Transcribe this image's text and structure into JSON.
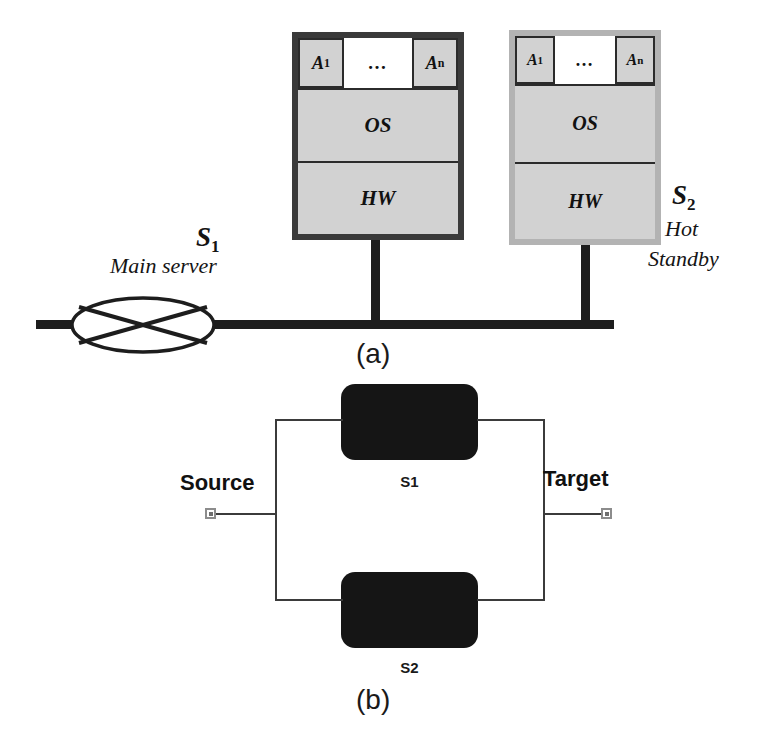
{
  "figure": {
    "part_a_caption": "(a)",
    "part_b_caption": "(b)"
  },
  "part_a": {
    "servers": [
      {
        "id": "S",
        "subscript": "1",
        "role_line1": "Main server",
        "role_line2": "",
        "apps": [
          {
            "name": "A",
            "subscript": "1"
          },
          {
            "name": "…",
            "subscript": ""
          },
          {
            "name": "A",
            "subscript": "n"
          }
        ],
        "layers": [
          "OS",
          "HW"
        ],
        "border_color": "#3a3a3a",
        "fill_color": "#d2d2d2"
      },
      {
        "id": "S",
        "subscript": "2",
        "role_line1": "Hot",
        "role_line2": "Standby",
        "apps": [
          {
            "name": "A",
            "subscript": "1"
          },
          {
            "name": "…",
            "subscript": ""
          },
          {
            "name": "A",
            "subscript": "n"
          }
        ],
        "layers": [
          "OS",
          "HW"
        ],
        "border_color": "#b3b3b3",
        "fill_color": "#d2d2d2"
      }
    ],
    "bus": {
      "terminator_icon": "crossed-ellipse-icon",
      "line_color": "#1d1d1d"
    }
  },
  "part_b": {
    "source_label": "Source",
    "target_label": "Target",
    "blocks": [
      {
        "label": "S1",
        "fill_color": "#151515"
      },
      {
        "label": "S2",
        "fill_color": "#151515"
      }
    ],
    "wire_color": "#3b3b3b"
  }
}
